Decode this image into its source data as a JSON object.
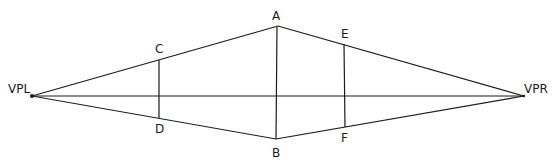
{
  "diagram": {
    "labels": {
      "vpl": "VPL",
      "vpr": "VPR",
      "a": "A",
      "b": "B",
      "c": "C",
      "d": "D",
      "e": "E",
      "f": "F"
    },
    "points": {
      "VPL": [
        32,
        96
      ],
      "VPR": [
        524,
        96
      ],
      "A": [
        278,
        26
      ],
      "B": [
        276,
        139
      ],
      "C": [
        159,
        60
      ],
      "D": [
        159,
        118
      ],
      "E": [
        344,
        44
      ],
      "F": [
        345,
        127
      ]
    },
    "line_color": "#1a1a1a"
  }
}
